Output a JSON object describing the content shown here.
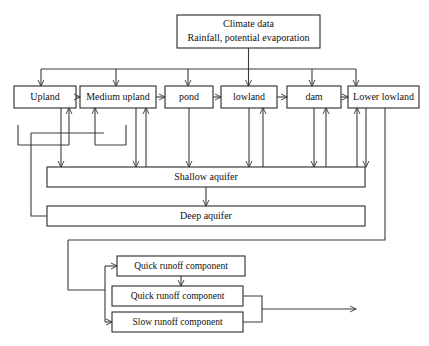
{
  "diagram": {
    "colors": {
      "stroke": "#3a3a3a",
      "box_stroke": "#2b2b2b",
      "background": "#ffffff",
      "text": "#111111"
    },
    "climate": {
      "line1": "Climate data",
      "line2": "Rainfall, potential evaporation"
    },
    "land_units": [
      {
        "id": "upland",
        "label": "Upland"
      },
      {
        "id": "medium-upland",
        "label": "Medium upland"
      },
      {
        "id": "pond",
        "label": "pond"
      },
      {
        "id": "lowland",
        "label": "lowland"
      },
      {
        "id": "dam",
        "label": "dam"
      },
      {
        "id": "lower-lowland",
        "label": "Lower lowland"
      }
    ],
    "aquifers": [
      {
        "id": "shallow-aquifer",
        "label": "Shallow aquifer"
      },
      {
        "id": "deep-aquifer",
        "label": "Deep aquifer"
      }
    ],
    "runoff_components": [
      {
        "id": "quick-runoff-1",
        "label": "Quick runoff component"
      },
      {
        "id": "quick-runoff-2",
        "label": "Quick runoff component"
      },
      {
        "id": "slow-runoff",
        "label": "Slow runoff component"
      }
    ]
  }
}
